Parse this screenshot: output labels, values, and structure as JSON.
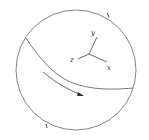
{
  "diagram": {
    "type": "sphere-with-coordinate-axes",
    "stroke_color": "#555555",
    "axes": [
      {
        "name": "y",
        "label": "y"
      },
      {
        "name": "z",
        "label": "z"
      },
      {
        "name": "x",
        "label": "x"
      }
    ],
    "elements": [
      "circle-outline",
      "great-circle-curve",
      "direction-arrow",
      "tick-mark-top-right",
      "tick-mark-bottom-left"
    ]
  }
}
